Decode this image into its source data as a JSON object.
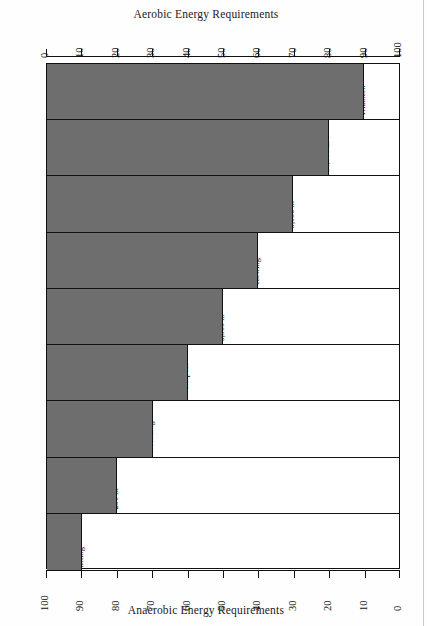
{
  "titles": {
    "top": "Aerobic Energy Requirements",
    "bottom": "Anaerobic Energy Requirements"
  },
  "axes": {
    "top": {
      "labels": [
        "0",
        "10",
        "20",
        "30",
        "40",
        "50",
        "60",
        "70",
        "80",
        "90",
        "100"
      ]
    },
    "bottom": {
      "labels": [
        "100",
        "90",
        "80",
        "70",
        "60",
        "50",
        "40",
        "30",
        "20",
        "10",
        "0"
      ]
    }
  },
  "chart_data": {
    "type": "bar",
    "orientation": "horizontal",
    "title": "Aerobic Energy Requirements",
    "xlabel": "Aerobic Energy Requirements",
    "ylabel": "Anaerobic Energy Requirements",
    "xlim": [
      0,
      100
    ],
    "grid": false,
    "legend": "none",
    "note": "Each row's grey bar length = aerobic % (top axis); the remainder, labelled with the anaerobic %, lists sports at that anaerobic level.",
    "categories": [
      "90%",
      "80%",
      "70%",
      "60%",
      "50%",
      "40%",
      "30%",
      "20%",
      "10%"
    ],
    "values": [
      10,
      20,
      30,
      40,
      50,
      60,
      70,
      80,
      90
    ],
    "anaerobic_values": [
      90,
      80,
      70,
      60,
      50,
      40,
      30,
      20,
      10
    ],
    "rows": [
      {
        "percent": "90%",
        "aerobic": 10,
        "anaerobic": 90,
        "sports": [
          "Diving",
          "Football",
          "Swimming",
          "50-100 m",
          "Track",
          "100-200 m",
          "Field",
          "events",
          "Weight",
          "lifting"
        ]
      },
      {
        "percent": "80%",
        "aerobic": 20,
        "anaerobic": 80,
        "sports": [
          "Alpine",
          "skiing",
          "Baseball",
          "Gymnastics",
          "Ice hockey",
          "Goalkeeper",
          "Soccer",
          "Goalkeeper",
          "Softball",
          "Speed",
          "skating",
          "400 m",
          "Surfing",
          "Track",
          "400-800 m",
          "Swimming",
          "200 m"
        ]
      },
      {
        "percent": "70%",
        "aerobic": 30,
        "anaerobic": 70,
        "sports": [
          "Aikido",
          "Boxing",
          "Figure",
          "skating",
          "Ice hockey",
          "Roller",
          "skating",
          "Swimming",
          "400 m",
          "Track",
          "1,500 m",
          "Volleyball",
          "Wrestling"
        ]
      },
      {
        "percent": "60%",
        "aerobic": 40,
        "anaerobic": 60,
        "sports": [
          "Badminton",
          "Rugby",
          "Table",
          "tennis",
          "TENNIS",
          "Waterpolo"
        ],
        "bold_items": [
          "TENNIS"
        ]
      },
      {
        "percent": "50%",
        "aerobic": 50,
        "anaerobic": 50,
        "sports": [
          "Basketball",
          "Field",
          "hockey",
          "Racquetball",
          "Soccer",
          "Squash",
          "Swimming",
          "800 m",
          "Track",
          "3,000 m"
        ]
      },
      {
        "percent": "40%",
        "aerobic": 60,
        "anaerobic": 40,
        "sports": [
          "Canoeing",
          "Kayaking",
          "Moun-",
          "taineering",
          "Rowing"
        ]
      },
      {
        "percent": "30%",
        "aerobic": 70,
        "anaerobic": 30,
        "sports": [
          "Speed",
          "skating",
          "10,000 m",
          "Swimming",
          "1,500 m",
          "Track",
          "5,000 m"
        ]
      },
      {
        "percent": "20%",
        "aerobic": 80,
        "anaerobic": 20,
        "sports": [
          "Orienteering",
          "Track",
          "10,000 m"
        ]
      },
      {
        "percent": "10%",
        "aerobic": 90,
        "anaerobic": 10,
        "sports": [
          "Marathon",
          "Triathlon"
        ]
      }
    ]
  },
  "colors": {
    "bar": "#6e6e6e",
    "axis": "#111111",
    "background": "#ffffff"
  }
}
